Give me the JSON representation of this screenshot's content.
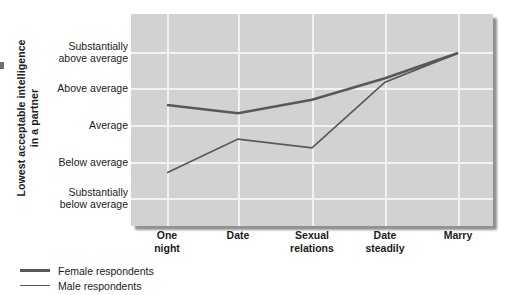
{
  "chart_data": {
    "type": "line",
    "title": "",
    "xlabel": "",
    "ylabel": "Lowest acceptable intelligence in a partner",
    "categories": [
      "One night",
      "Date",
      "Sexual relations",
      "Date steadily",
      "Marry"
    ],
    "ytick_labels": [
      "Substantially above average",
      "Above average",
      "Average",
      "Below average",
      "Substantially below average"
    ],
    "ylim": [
      1,
      5
    ],
    "ylevels": [
      5,
      4,
      3,
      2,
      1
    ],
    "grid": true,
    "legend_position": "below-left",
    "series": [
      {
        "name": "Female respondents",
        "color": "#585858",
        "linewidth": 2.6,
        "values": [
          3.54,
          3.32,
          3.68,
          4.27,
          4.97
        ]
      },
      {
        "name": "Male respondents",
        "color": "#585858",
        "linewidth": 1.7,
        "values": [
          1.7,
          2.62,
          2.38,
          4.16,
          4.97
        ]
      }
    ]
  },
  "axis": {
    "y_title_line1": "Lowest acceptable intelligence",
    "y_title_line2": "in a partner"
  },
  "ticks": {
    "y": [
      {
        "line1": "Substantially",
        "line2": "above average"
      },
      {
        "line1": "Above average",
        "line2": ""
      },
      {
        "line1": "Average",
        "line2": ""
      },
      {
        "line1": "Below average",
        "line2": ""
      },
      {
        "line1": "Substantially",
        "line2": "below average"
      }
    ],
    "x": [
      {
        "line1": "One",
        "line2": "night"
      },
      {
        "line1": "Date",
        "line2": ""
      },
      {
        "line1": "Sexual",
        "line2": "relations"
      },
      {
        "line1": "Date",
        "line2": "steadily"
      },
      {
        "line1": "Marry",
        "line2": ""
      }
    ]
  },
  "legend": {
    "items": [
      {
        "label": "Female respondents"
      },
      {
        "label": "Male respondents"
      }
    ]
  },
  "colors": {
    "plot_background": "#d2d2d2",
    "gridline": "#f2f2f2",
    "line": "#585858",
    "text": "#1b1b1b"
  }
}
